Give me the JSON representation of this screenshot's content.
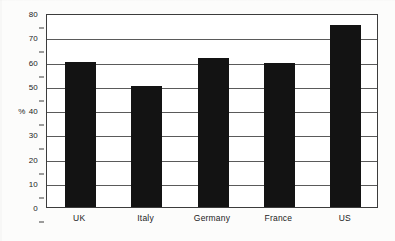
{
  "chart_data": {
    "type": "bar",
    "title": "",
    "subtitle": "",
    "xlabel": "",
    "ylabel": "%",
    "categories": [
      "UK",
      "Italy",
      "Germany",
      "France",
      "US"
    ],
    "values": [
      60,
      50,
      61.5,
      59.5,
      75
    ],
    "series": [
      {
        "name": "",
        "values": [
          60,
          50,
          61.5,
          59.5,
          75
        ],
        "color": "#131313"
      }
    ],
    "ylim": [
      0,
      80
    ],
    "ytick_values": [
      0,
      10,
      20,
      30,
      40,
      50,
      60,
      70,
      80
    ],
    "ytick_labels": [
      "0",
      "10",
      "20",
      "30",
      "40",
      "50",
      "60",
      "70",
      "80"
    ],
    "ylabel_attached_to_tick": "40",
    "grid": true,
    "grid_axis": "y",
    "legend": false,
    "legend_position": "none",
    "annotations": [],
    "bar_color": "#131313",
    "plot_background": "#ffffff",
    "axis_color": "#3c3c3c"
  },
  "axis": {
    "percent_symbol": "%"
  }
}
